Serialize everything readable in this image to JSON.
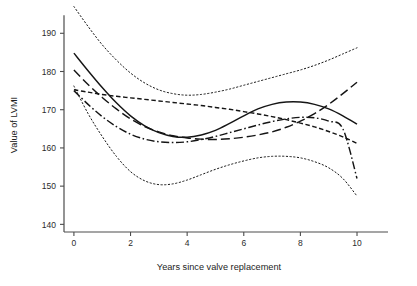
{
  "chart_data": {
    "type": "line",
    "title": "",
    "xlabel": "Years since valve replacement",
    "ylabel": "Value of LVMI",
    "xlim": [
      -0.35,
      10.6
    ],
    "ylim": [
      138.0,
      194.0
    ],
    "xticks": [
      0,
      2,
      4,
      6,
      8,
      10
    ],
    "xticklabels": [
      "0",
      "2",
      "4",
      "6",
      "8",
      "10"
    ],
    "yticks": [
      140,
      150,
      160,
      170,
      180,
      190
    ],
    "yticklabels": [
      "140",
      "150",
      "160",
      "170",
      "180",
      "190"
    ],
    "grid": false,
    "legend": "none",
    "background": "#ffffff",
    "line_color": "#151515",
    "x": [
      0,
      0.5,
      1,
      1.5,
      2,
      2.5,
      3,
      3.5,
      4,
      4.5,
      5,
      5.5,
      6,
      6.5,
      7,
      7.5,
      8,
      8.5,
      9,
      9.5,
      10
    ],
    "series": [
      {
        "name": "solid-curve",
        "style": "solid",
        "dash": "none",
        "values": [
          184.8,
          180.2,
          175.8,
          171.8,
          168.4,
          165.8,
          164.0,
          163.0,
          162.8,
          163.4,
          164.6,
          166.4,
          168.4,
          170.2,
          171.4,
          172.0,
          172.0,
          171.4,
          170.2,
          168.4,
          166.2
        ]
      },
      {
        "name": "long-dash-curve",
        "style": "long-dash",
        "dash": "9,4",
        "values": [
          180.4,
          176.6,
          173.2,
          170.2,
          167.6,
          165.6,
          164.2,
          163.2,
          162.6,
          162.3,
          162.2,
          162.4,
          162.8,
          163.4,
          164.2,
          165.4,
          167.0,
          169.0,
          171.4,
          174.2,
          177.2
        ]
      },
      {
        "name": "short-dash-curve",
        "style": "short-dash",
        "dash": "4.5,2.6",
        "values": [
          175.2,
          174.6,
          174.0,
          173.5,
          173.1,
          172.7,
          172.3,
          171.9,
          171.5,
          171.1,
          170.6,
          170.1,
          169.5,
          168.9,
          168.2,
          167.4,
          166.5,
          165.5,
          164.3,
          162.9,
          161.2
        ]
      },
      {
        "name": "dash-dot-curve",
        "style": "dash-dot",
        "dash": "8,2.6,1.6,2.6",
        "values": [
          175.0,
          171.4,
          168.2,
          165.6,
          163.6,
          162.3,
          161.6,
          161.4,
          161.6,
          162.2,
          163.0,
          164.0,
          165.0,
          166.0,
          166.9,
          167.6,
          168.0,
          167.9,
          167.0,
          165.0,
          152.0
        ]
      },
      {
        "name": "upper-confidence-band",
        "style": "dotted",
        "dash": "1.3,2.4",
        "values": [
          197.0,
          191.8,
          187.0,
          183.0,
          179.6,
          177.0,
          175.2,
          174.2,
          173.8,
          174.0,
          174.6,
          175.4,
          176.4,
          177.4,
          178.4,
          179.4,
          180.4,
          181.6,
          183.0,
          184.6,
          186.2
        ]
      },
      {
        "name": "lower-confidence-band",
        "style": "dotted",
        "dash": "1.3,2.4",
        "values": [
          176.2,
          169.0,
          163.0,
          157.8,
          153.8,
          151.4,
          150.4,
          150.6,
          151.6,
          153.0,
          154.4,
          155.6,
          156.6,
          157.4,
          157.8,
          157.8,
          157.4,
          156.4,
          154.8,
          152.0,
          147.4
        ]
      }
    ]
  },
  "figure": {
    "plot_left": 64,
    "plot_right": 374,
    "plot_top": 18,
    "plot_bottom": 232
  }
}
